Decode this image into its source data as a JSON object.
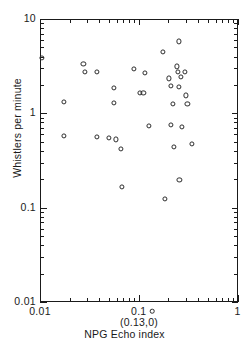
{
  "chart_data": {
    "type": "scatter",
    "title": "",
    "xlabel": "NPG Echo index",
    "ylabel": "Whistlers per minute",
    "xscale": "log",
    "yscale": "log",
    "xlim": [
      0.01,
      1
    ],
    "ylim": [
      0.01,
      10
    ],
    "grid": false,
    "legend": null,
    "xticklabels": [
      "0.01",
      "0.1",
      "1"
    ],
    "xtickvalues": [
      0.01,
      0.1,
      1
    ],
    "yticklabels": [
      "10",
      "1",
      "0.1",
      "0.01"
    ],
    "ytickvalues": [
      10,
      1,
      0.1,
      0.01
    ],
    "annotations": [
      {
        "text": "(0.13,0)",
        "x": 0.13,
        "y": 0,
        "note": "off-scale point plotted below the x axis"
      }
    ],
    "marker": "open-circle",
    "points": [
      {
        "x": 0.0105,
        "y": 3.9
      },
      {
        "x": 0.0175,
        "y": 1.33
      },
      {
        "x": 0.0175,
        "y": 0.58
      },
      {
        "x": 0.0275,
        "y": 3.35
      },
      {
        "x": 0.0285,
        "y": 2.75
      },
      {
        "x": 0.0375,
        "y": 2.75
      },
      {
        "x": 0.0375,
        "y": 0.56
      },
      {
        "x": 0.0495,
        "y": 0.55
      },
      {
        "x": 0.0555,
        "y": 1.85
      },
      {
        "x": 0.0565,
        "y": 1.3
      },
      {
        "x": 0.0585,
        "y": 0.53
      },
      {
        "x": 0.0665,
        "y": 0.42
      },
      {
        "x": 0.0675,
        "y": 0.165
      },
      {
        "x": 0.0885,
        "y": 2.95
      },
      {
        "x": 0.1035,
        "y": 1.65
      },
      {
        "x": 0.1115,
        "y": 1.65
      },
      {
        "x": 0.1145,
        "y": 2.7
      },
      {
        "x": 0.1275,
        "y": 0.73
      },
      {
        "x": 0.1755,
        "y": 4.5
      },
      {
        "x": 0.1855,
        "y": 0.125
      },
      {
        "x": 0.2025,
        "y": 2.35
      },
      {
        "x": 0.2115,
        "y": 1.95
      },
      {
        "x": 0.2135,
        "y": 0.75
      },
      {
        "x": 0.2225,
        "y": 1.25
      },
      {
        "x": 0.2275,
        "y": 0.44
      },
      {
        "x": 0.2455,
        "y": 3.15
      },
      {
        "x": 0.2475,
        "y": 2.75
      },
      {
        "x": 0.2545,
        "y": 5.8
      },
      {
        "x": 0.2555,
        "y": 1.9
      },
      {
        "x": 0.2585,
        "y": 0.195
      },
      {
        "x": 0.2695,
        "y": 2.45
      },
      {
        "x": 0.2735,
        "y": 0.72
      },
      {
        "x": 0.2945,
        "y": 2.75
      },
      {
        "x": 0.3005,
        "y": 1.55
      },
      {
        "x": 0.3105,
        "y": 1.25
      },
      {
        "x": 0.3455,
        "y": 0.47
      }
    ]
  },
  "axis": {
    "x_title": "NPG Echo index",
    "y_title": "Whistlers per minute",
    "offscale_label": "(0.13,0)"
  }
}
